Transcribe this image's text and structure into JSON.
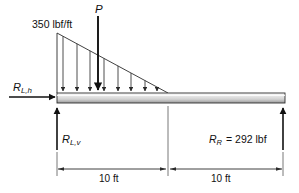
{
  "figure": {
    "type": "free-body-diagram",
    "labels": {
      "distributed_load": "350 lbf/ft",
      "point_load": "P",
      "reaction_left_horizontal_symbol": "R",
      "reaction_left_horizontal_sub": "L,h",
      "reaction_left_vertical_symbol": "R",
      "reaction_left_vertical_sub": "L,v",
      "reaction_right_symbol": "R",
      "reaction_right_sub": "R",
      "reaction_right_value": "= 292 lbf",
      "dimension_left": "10 ft",
      "dimension_right": "10 ft"
    },
    "colors": {
      "ink": "#111111",
      "beam_top": "#f2f2f2",
      "beam_mid": "#d4d4d4",
      "beam_bottom": "#8a8a8a",
      "arrow_gray": "#3a3a3a",
      "background": "#ffffff"
    },
    "geometry": {
      "beam_left_x": 57,
      "beam_right_x": 285,
      "beam_top_y": 93,
      "beam_bottom_y": 103,
      "load_apex_x": 57,
      "load_apex_y": 33,
      "load_end_x": 168,
      "point_load_x": 98,
      "distributed_arrow_count": 8,
      "dimension_line_y": 169,
      "support_left_x": 57,
      "support_right_x": 283
    }
  }
}
